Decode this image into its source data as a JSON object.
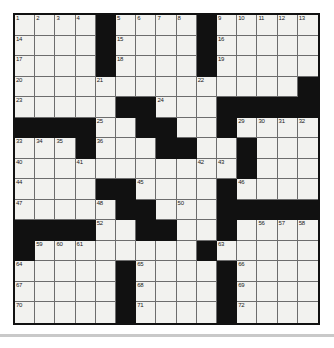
{
  "puzzle": {
    "title": "Crossword Grid",
    "size": {
      "rows": 15,
      "cols": 15
    },
    "colors": {
      "block": "#111111",
      "cell": "#f2f2ef",
      "cell_border": "#6d6d6d",
      "outer_border": "#111111",
      "page_background": "#ffffff",
      "footer_rule": "#c9c9c9"
    },
    "block_char": "#",
    "open_char": ".",
    "layout": [
      "....#....#.....",
      "....#....#.....",
      "....#....#.....",
      "..............#",
      ".....##...#####",
      "####..##..#....",
      "...#...##..#...",
      "...........#...",
      "....##....#....",
      ".....##...#####",
      "####..##..#....",
      "#........#.....",
      ".....#....#....",
      ".....#....#....",
      ".....#....#...."
    ],
    "numbers": [
      {
        "n": 1,
        "row": 0,
        "col": 0
      },
      {
        "n": 2,
        "row": 0,
        "col": 1
      },
      {
        "n": 3,
        "row": 0,
        "col": 2
      },
      {
        "n": 4,
        "row": 0,
        "col": 3
      },
      {
        "n": 5,
        "row": 0,
        "col": 5
      },
      {
        "n": 6,
        "row": 0,
        "col": 6
      },
      {
        "n": 7,
        "row": 0,
        "col": 7
      },
      {
        "n": 8,
        "row": 0,
        "col": 8
      },
      {
        "n": 9,
        "row": 0,
        "col": 10
      },
      {
        "n": 10,
        "row": 0,
        "col": 11
      },
      {
        "n": 11,
        "row": 0,
        "col": 12
      },
      {
        "n": 12,
        "row": 0,
        "col": 13
      },
      {
        "n": 13,
        "row": 0,
        "col": 14
      },
      {
        "n": 14,
        "row": 1,
        "col": 0
      },
      {
        "n": 15,
        "row": 1,
        "col": 5
      },
      {
        "n": 16,
        "row": 1,
        "col": 10
      },
      {
        "n": 17,
        "row": 2,
        "col": 0
      },
      {
        "n": 18,
        "row": 2,
        "col": 5
      },
      {
        "n": 19,
        "row": 2,
        "col": 10
      },
      {
        "n": 20,
        "row": 3,
        "col": 0
      },
      {
        "n": 21,
        "row": 3,
        "col": 4
      },
      {
        "n": 22,
        "row": 3,
        "col": 9
      },
      {
        "n": 23,
        "row": 4,
        "col": 0
      },
      {
        "n": 24,
        "row": 4,
        "col": 7
      },
      {
        "n": 25,
        "row": 5,
        "col": 4
      },
      {
        "n": 26,
        "row": 5,
        "col": 6
      },
      {
        "n": 27,
        "row": 5,
        "col": 7
      },
      {
        "n": 28,
        "row": 5,
        "col": 10
      },
      {
        "n": 29,
        "row": 5,
        "col": 11
      },
      {
        "n": 30,
        "row": 5,
        "col": 12
      },
      {
        "n": 31,
        "row": 5,
        "col": 13
      },
      {
        "n": 32,
        "row": 5,
        "col": 14
      },
      {
        "n": 33,
        "row": 6,
        "col": 0
      },
      {
        "n": 34,
        "row": 6,
        "col": 1
      },
      {
        "n": 35,
        "row": 6,
        "col": 2
      },
      {
        "n": 36,
        "row": 6,
        "col": 4
      },
      {
        "n": 37,
        "row": 6,
        "col": 7
      },
      {
        "n": 38,
        "row": 6,
        "col": 8
      },
      {
        "n": 39,
        "row": 6,
        "col": 11
      },
      {
        "n": 40,
        "row": 7,
        "col": 0
      },
      {
        "n": 41,
        "row": 7,
        "col": 3
      },
      {
        "n": 42,
        "row": 7,
        "col": 9
      },
      {
        "n": 43,
        "row": 7,
        "col": 10
      },
      {
        "n": 44,
        "row": 8,
        "col": 0
      },
      {
        "n": 45,
        "row": 8,
        "col": 6
      },
      {
        "n": 46,
        "row": 8,
        "col": 11
      },
      {
        "n": 47,
        "row": 9,
        "col": 0
      },
      {
        "n": 48,
        "row": 9,
        "col": 4
      },
      {
        "n": 49,
        "row": 9,
        "col": 5
      },
      {
        "n": 50,
        "row": 9,
        "col": 8
      },
      {
        "n": 51,
        "row": 9,
        "col": 11
      },
      {
        "n": 52,
        "row": 10,
        "col": 4
      },
      {
        "n": 53,
        "row": 10,
        "col": 6
      },
      {
        "n": 54,
        "row": 10,
        "col": 7
      },
      {
        "n": 55,
        "row": 10,
        "col": 10
      },
      {
        "n": 56,
        "row": 10,
        "col": 12
      },
      {
        "n": 57,
        "row": 10,
        "col": 13
      },
      {
        "n": 58,
        "row": 10,
        "col": 14
      },
      {
        "n": 59,
        "row": 11,
        "col": 1
      },
      {
        "n": 60,
        "row": 11,
        "col": 2
      },
      {
        "n": 61,
        "row": 11,
        "col": 3
      },
      {
        "n": 62,
        "row": 11,
        "col": 9
      },
      {
        "n": 63,
        "row": 11,
        "col": 10
      },
      {
        "n": 64,
        "row": 12,
        "col": 0
      },
      {
        "n": 65,
        "row": 12,
        "col": 6
      },
      {
        "n": 66,
        "row": 12,
        "col": 11
      },
      {
        "n": 67,
        "row": 13,
        "col": 0
      },
      {
        "n": 68,
        "row": 13,
        "col": 6
      },
      {
        "n": 69,
        "row": 13,
        "col": 11
      },
      {
        "n": 70,
        "row": 14,
        "col": 0
      },
      {
        "n": 71,
        "row": 14,
        "col": 6
      },
      {
        "n": 72,
        "row": 14,
        "col": 11
      }
    ]
  }
}
